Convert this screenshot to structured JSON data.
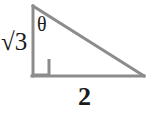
{
  "figure": {
    "shape": "right triangle",
    "background_color": "#ffffff",
    "stroke_color": "#8c8c8c",
    "text_color": "#1a1a1a",
    "stroke_width": 3,
    "labels": {
      "vertical_leg": "√3",
      "vertical_leg_plain": "sqrt(3)",
      "horizontal_leg": "2",
      "angle": "θ"
    },
    "vertices": {
      "top": [
        32,
        6
      ],
      "bottom_left": [
        32,
        76
      ],
      "bottom_right": [
        144,
        76
      ]
    },
    "right_angle_marker": {
      "at": "bottom_left",
      "size": 17
    }
  }
}
